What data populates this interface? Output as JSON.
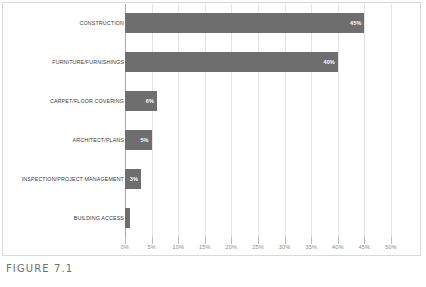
{
  "figure": {
    "caption": "FIGURE 7.1"
  },
  "chart_data": {
    "type": "bar",
    "orientation": "horizontal",
    "title": "",
    "subtitle": "",
    "xlabel": "",
    "ylabel": "",
    "xlim": [
      0,
      50
    ],
    "xtick_step": 5,
    "grid": true,
    "legend": false,
    "value_unit": "%",
    "bar_color": "#6e6e6e",
    "gridline_color": "#e3e3e3",
    "axis_color": "#a8a8a8",
    "categories": [
      "CONSTRUCTION",
      "FURNITURE/FURNISHINGS",
      "CARPET/FLOOR COVERING",
      "ARCHITECT/PLANS",
      "INSPECTION/PROJECT MANAGEMENT",
      "BUILDING ACCESS"
    ],
    "values": [
      45,
      40,
      6,
      5,
      3,
      1
    ],
    "data_labels": [
      "45%",
      "40%",
      "6%",
      "5%",
      "3%",
      ""
    ],
    "xtick_labels": [
      "0%",
      "5%",
      "10%",
      "15%",
      "20%",
      "25%",
      "30%",
      "35%",
      "40%",
      "45%",
      "50%"
    ],
    "xtick_values": [
      0,
      5,
      10,
      15,
      20,
      25,
      30,
      35,
      40,
      45,
      50
    ]
  }
}
